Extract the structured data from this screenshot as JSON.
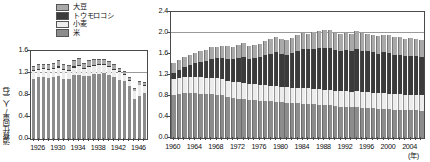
{
  "legend": {
    "items": [
      {
        "label": "大豆",
        "key": "soy",
        "color": "#a9a9a9"
      },
      {
        "label": "トウモロコシ",
        "key": "corn",
        "color": "#3b3b3b"
      },
      {
        "label": "小麦",
        "key": "wheat",
        "color": "#ececec"
      },
      {
        "label": "米",
        "key": "rice",
        "color": "#8c8c8c"
      }
    ]
  },
  "chart_data": [
    {
      "id": "left",
      "type": "bar",
      "stacked": true,
      "title": "",
      "xlabel": "",
      "ylabel": "消費仕向量/人（石）",
      "ylim": [
        0.0,
        1.6
      ],
      "yticks": [
        0.0,
        0.4,
        0.8,
        1.2,
        1.6
      ],
      "ytick_labels": [
        "0.0",
        "0.4",
        "0.8",
        "1.2",
        "1.6"
      ],
      "gridlines": [
        1.2
      ],
      "grid": true,
      "legend_position": "above-left",
      "x": [
        1925,
        1926,
        1927,
        1928,
        1929,
        1930,
        1931,
        1932,
        1933,
        1934,
        1935,
        1936,
        1937,
        1938,
        1939,
        1940,
        1941,
        1942,
        1943,
        1944,
        1945,
        1946,
        1947
      ],
      "xtick_labels": [
        "1926",
        "1930",
        "1934",
        "1938",
        "1942",
        "1946"
      ],
      "xtick_values": [
        1926,
        1930,
        1934,
        1938,
        1942,
        1946
      ],
      "series": [
        {
          "name": "米",
          "key": "rice",
          "values": [
            1.09,
            1.12,
            1.12,
            1.11,
            1.13,
            1.14,
            1.1,
            1.1,
            1.17,
            1.17,
            1.14,
            1.15,
            1.18,
            1.19,
            1.2,
            1.17,
            1.12,
            1.08,
            1.05,
            0.96,
            0.72,
            0.78,
            0.83
          ]
        },
        {
          "name": "小麦",
          "key": "wheat",
          "values": [
            0.14,
            0.13,
            0.15,
            0.14,
            0.14,
            0.16,
            0.15,
            0.14,
            0.13,
            0.16,
            0.14,
            0.16,
            0.15,
            0.15,
            0.14,
            0.14,
            0.14,
            0.13,
            0.11,
            0.1,
            0.15,
            0.2,
            0.14
          ]
        },
        {
          "name": "トウモロコシ",
          "key": "corn",
          "values": [
            0.02,
            0.02,
            0.02,
            0.02,
            0.02,
            0.02,
            0.02,
            0.02,
            0.02,
            0.02,
            0.02,
            0.02,
            0.02,
            0.02,
            0.02,
            0.02,
            0.02,
            0.02,
            0.02,
            0.01,
            0.01,
            0.01,
            0.01
          ]
        },
        {
          "name": "大豆",
          "key": "soy",
          "values": [
            0.08,
            0.1,
            0.07,
            0.09,
            0.1,
            0.12,
            0.09,
            0.08,
            0.11,
            0.13,
            0.09,
            0.1,
            0.11,
            0.1,
            0.09,
            0.09,
            0.08,
            0.07,
            0.06,
            0.05,
            0.04,
            0.06,
            0.05
          ]
        }
      ]
    },
    {
      "id": "right",
      "type": "bar",
      "stacked": true,
      "title": "",
      "xlabel": "(年)",
      "ylabel": "",
      "ylim": [
        0.0,
        2.4
      ],
      "yticks": [
        0.0,
        0.4,
        0.8,
        1.2,
        1.6,
        2.0,
        2.4
      ],
      "ytick_labels": [
        "0.0",
        "0.4",
        "0.8",
        "1.2",
        "1.6",
        "2.0",
        "2.4"
      ],
      "gridlines": [
        2.0
      ],
      "grid": true,
      "legend_position": "shared",
      "x": [
        1960,
        1961,
        1962,
        1963,
        1964,
        1965,
        1966,
        1967,
        1968,
        1969,
        1970,
        1971,
        1972,
        1973,
        1974,
        1975,
        1976,
        1977,
        1978,
        1979,
        1980,
        1981,
        1982,
        1983,
        1984,
        1985,
        1986,
        1987,
        1988,
        1989,
        1990,
        1991,
        1992,
        1993,
        1994,
        1995,
        1996,
        1997,
        1998,
        1999,
        2000,
        2001,
        2002,
        2003,
        2004,
        2005,
        2006
      ],
      "xtick_labels": [
        "1960",
        "1964",
        "1968",
        "1972",
        "1976",
        "1980",
        "1984",
        "1988",
        "1992",
        "1996",
        "2000",
        "2004"
      ],
      "xtick_values": [
        1960,
        1964,
        1968,
        1972,
        1976,
        1980,
        1984,
        1988,
        1992,
        1996,
        2000,
        2004
      ],
      "series": [
        {
          "name": "米",
          "key": "rice",
          "values": [
            0.82,
            0.84,
            0.86,
            0.86,
            0.85,
            0.84,
            0.83,
            0.83,
            0.82,
            0.81,
            0.78,
            0.76,
            0.75,
            0.74,
            0.73,
            0.72,
            0.71,
            0.71,
            0.7,
            0.69,
            0.68,
            0.67,
            0.66,
            0.66,
            0.65,
            0.65,
            0.64,
            0.63,
            0.62,
            0.62,
            0.61,
            0.6,
            0.6,
            0.59,
            0.6,
            0.58,
            0.58,
            0.57,
            0.56,
            0.56,
            0.55,
            0.54,
            0.54,
            0.53,
            0.53,
            0.53,
            0.52
          ]
        },
        {
          "name": "小麦",
          "key": "wheat",
          "values": [
            0.3,
            0.31,
            0.31,
            0.31,
            0.32,
            0.32,
            0.32,
            0.32,
            0.32,
            0.32,
            0.31,
            0.31,
            0.31,
            0.31,
            0.3,
            0.3,
            0.3,
            0.3,
            0.3,
            0.3,
            0.3,
            0.3,
            0.3,
            0.3,
            0.3,
            0.3,
            0.3,
            0.3,
            0.3,
            0.3,
            0.29,
            0.29,
            0.29,
            0.29,
            0.3,
            0.29,
            0.29,
            0.29,
            0.29,
            0.29,
            0.29,
            0.29,
            0.29,
            0.29,
            0.29,
            0.29,
            0.29
          ]
        },
        {
          "name": "トウモロコシ",
          "key": "corn",
          "values": [
            0.12,
            0.15,
            0.18,
            0.22,
            0.25,
            0.28,
            0.32,
            0.36,
            0.38,
            0.4,
            0.42,
            0.43,
            0.47,
            0.5,
            0.48,
            0.5,
            0.53,
            0.57,
            0.6,
            0.64,
            0.63,
            0.62,
            0.66,
            0.7,
            0.74,
            0.74,
            0.75,
            0.78,
            0.8,
            0.8,
            0.78,
            0.77,
            0.78,
            0.77,
            0.79,
            0.79,
            0.78,
            0.77,
            0.76,
            0.78,
            0.78,
            0.76,
            0.76,
            0.74,
            0.74,
            0.74,
            0.73
          ]
        },
        {
          "name": "大豆",
          "key": "soy",
          "values": [
            0.18,
            0.18,
            0.19,
            0.19,
            0.2,
            0.21,
            0.21,
            0.22,
            0.22,
            0.23,
            0.24,
            0.24,
            0.25,
            0.26,
            0.25,
            0.26,
            0.26,
            0.27,
            0.28,
            0.29,
            0.28,
            0.28,
            0.29,
            0.3,
            0.31,
            0.3,
            0.32,
            0.33,
            0.34,
            0.33,
            0.33,
            0.33,
            0.34,
            0.33,
            0.35,
            0.34,
            0.34,
            0.34,
            0.33,
            0.34,
            0.35,
            0.34,
            0.34,
            0.33,
            0.34,
            0.33,
            0.33
          ]
        }
      ]
    }
  ]
}
